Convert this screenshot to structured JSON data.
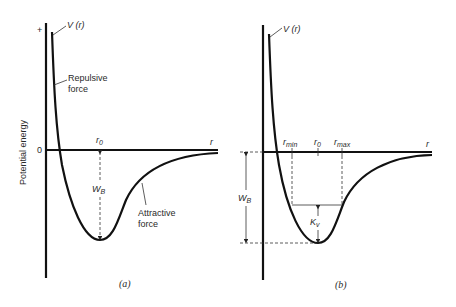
{
  "figure": {
    "y_axis_label": "Potential energy",
    "panel_a": {
      "caption": "(a)",
      "plus_mark": "+",
      "zero_mark": "0",
      "curve_label": "V (r)",
      "repulsive_label_line1": "Repulsive",
      "repulsive_label_line2": "force",
      "attractive_label_line1": "Attractive",
      "attractive_label_line2": "force",
      "r0_label": "r",
      "r0_sub": "0",
      "r_axis_label": "r",
      "wb_label": "W",
      "wb_sub": "B"
    },
    "panel_b": {
      "caption": "(b)",
      "curve_label": "V (r)",
      "rmin_label": "r",
      "rmin_sub": "min",
      "r0_label": "r",
      "r0_sub": "0",
      "rmax_label": "r",
      "rmax_sub": "max",
      "r_axis_label": "r",
      "wb_label": "W",
      "wb_sub": "B",
      "kv_label": "K",
      "kv_sub": "v"
    }
  }
}
